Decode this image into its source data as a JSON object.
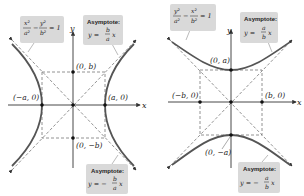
{
  "figure": {
    "colors": {
      "curve": "#555555",
      "axis": "#333333",
      "dashed": "#777777",
      "callout_bg": "#d9d9d9",
      "point": "#111111"
    }
  },
  "left_panel": {
    "equation": {
      "term1_num": "x²",
      "term1_den": "a²",
      "minus": "−",
      "term2_num": "y²",
      "term2_den": "b²",
      "rhs": "= 1"
    },
    "asymptote_upper": {
      "title": "Asymptote:",
      "lhs": "y =",
      "num": "b",
      "den": "a",
      "var": "x"
    },
    "asymptote_lower": {
      "title": "Asymptote:",
      "lhs": "y = −",
      "num": "b",
      "den": "a",
      "var": "x"
    },
    "axis_x": "x",
    "axis_y": "y",
    "points": {
      "top": "(0, b)",
      "bottom": "(0, −b)",
      "left": "(−a, 0)",
      "right": "(a, 0)"
    }
  },
  "right_panel": {
    "equation": {
      "term1_num": "y²",
      "term1_den": "a²",
      "minus": "−",
      "term2_num": "x²",
      "term2_den": "b²",
      "rhs": "= 1"
    },
    "asymptote_upper": {
      "title": "Asymptote:",
      "lhs": "y =",
      "num": "a",
      "den": "b",
      "var": "x"
    },
    "asymptote_lower": {
      "title": "Asymptote:",
      "lhs": "y = −",
      "num": "a",
      "den": "b",
      "var": "x"
    },
    "axis_x": "x",
    "axis_y": "y",
    "points": {
      "top": "(0, a)",
      "bottom": "(0, −a)",
      "left": "(−b, 0)",
      "right": "(b, 0)"
    }
  }
}
